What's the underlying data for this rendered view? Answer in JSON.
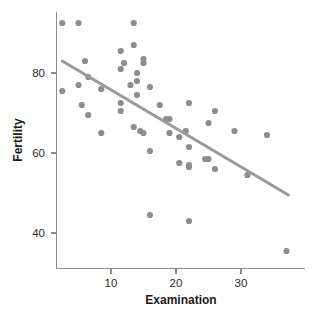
{
  "chart_data": {
    "type": "scatter",
    "title": "",
    "xlabel": "Examination",
    "ylabel": "Fertility",
    "xlim": [
      1.5,
      38
    ],
    "ylim": [
      33,
      94
    ],
    "grid": false,
    "legend": "none",
    "x_ticks": [
      10,
      20,
      30
    ],
    "y_ticks": [
      40,
      60,
      80
    ],
    "point_color": "#8d8d8d",
    "line_color": "#9a9a9a",
    "axis_color": "#8d8d8d",
    "x": [
      2.5,
      5.0,
      13.5,
      13.5,
      11.5,
      6.0,
      12.0,
      15.0,
      15.0,
      11.5,
      14.0,
      6.5,
      14.0,
      2.5,
      5.0,
      8.5,
      13.0,
      16.0,
      18.5,
      5.5,
      11.5,
      14.0,
      11.5,
      17.5,
      6.5,
      19.0,
      8.5,
      13.5,
      14.5,
      15.0,
      19.0,
      21.5,
      26.0,
      22.0,
      25.0,
      20.5,
      22.0,
      29.0,
      34.0,
      22.0,
      16.0,
      25.0,
      20.5,
      22.0,
      24.5,
      26.0,
      31.0,
      16.0,
      22.0,
      37.0
    ],
    "y": [
      92.5,
      92.5,
      92.5,
      87.0,
      85.5,
      83.0,
      82.5,
      83.5,
      82.5,
      81.0,
      80.0,
      79.0,
      78.0,
      75.5,
      77.0,
      76.0,
      77.0,
      76.5,
      68.5,
      72.0,
      72.5,
      74.5,
      70.5,
      72.0,
      69.5,
      68.5,
      65.0,
      66.5,
      65.5,
      65.0,
      65.0,
      65.5,
      70.5,
      72.5,
      67.5,
      64.0,
      61.5,
      65.5,
      64.5,
      57.0,
      60.5,
      58.5,
      57.5,
      56.5,
      58.5,
      56.0,
      54.5,
      44.5,
      43.0,
      35.5
    ],
    "trend_line": {
      "x_start": 2.5,
      "y_start": 83.0,
      "x_end": 37.3,
      "y_end": 49.5,
      "description": "linear regression fit"
    },
    "n_points": 50
  },
  "axis": {
    "x_tick_labels": [
      "10",
      "20",
      "30"
    ],
    "y_tick_labels": [
      "40",
      "60",
      "80"
    ],
    "x_title": "Examination",
    "y_title": "Fertility"
  }
}
